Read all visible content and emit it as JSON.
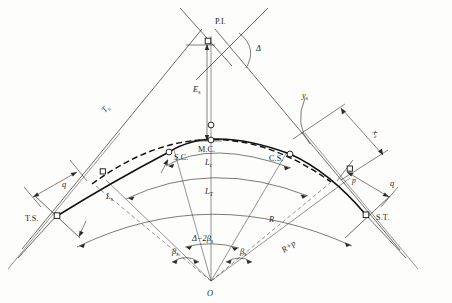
{
  "figure": {
    "type": "engineering-diagram",
    "background_color": "#fdfdfc",
    "line_color": "#2b2b2b"
  },
  "points": {
    "pi": "P.I.",
    "ts": "T.S.",
    "st": "S.T.",
    "sc": "S.C.",
    "cs": "C.S.",
    "mc": "M.C.",
    "o": "O"
  },
  "dimensions": {
    "tangent": "T",
    "tangent_sub": "s",
    "external": "E",
    "external_sub": "s",
    "spiral_len": "L",
    "spiral_len_sub": "s",
    "curve_len": "L",
    "curve_len_sub": "c",
    "total_len": "L",
    "total_len_sub": "T",
    "radius": "R",
    "radius_offset": "R+p",
    "shift": "p",
    "q": "q",
    "xs": "x",
    "xs_sub": "s",
    "ys": "y",
    "ys_sub": "s"
  },
  "angles": {
    "delta": "Δ",
    "beta_left": "β",
    "beta_left_sub": "s",
    "beta_right": "β",
    "beta_right_sub": "s",
    "central": "Δ−2β",
    "central_sub": "s"
  }
}
